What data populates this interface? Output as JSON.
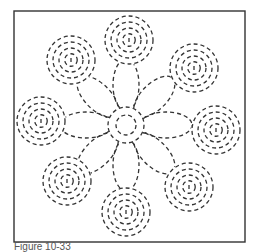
{
  "figure": {
    "caption": "Figure 10-33",
    "frame": {
      "x": 14,
      "y": 11,
      "width": 231,
      "height": 231,
      "stroke": "#333333"
    },
    "stroke_color": "#333333",
    "center": {
      "x": 126,
      "y": 125,
      "inner_radius": 10,
      "outer_radius": 18
    },
    "petals": {
      "count": 8,
      "length": 52,
      "width": 13,
      "start_angle_deg": -90
    },
    "spirals": [
      {
        "name": "top",
        "x": 129,
        "y": 40,
        "r": 24
      },
      {
        "name": "top-right",
        "x": 194,
        "y": 68,
        "r": 24
      },
      {
        "name": "right",
        "x": 216,
        "y": 130,
        "r": 24
      },
      {
        "name": "bottom-right",
        "x": 189,
        "y": 187,
        "r": 24
      },
      {
        "name": "bottom",
        "x": 126,
        "y": 212,
        "r": 24
      },
      {
        "name": "bottom-left",
        "x": 67,
        "y": 181,
        "r": 24
      },
      {
        "name": "left",
        "x": 41,
        "y": 121,
        "r": 24
      },
      {
        "name": "top-left",
        "x": 71,
        "y": 60,
        "r": 24
      }
    ]
  }
}
